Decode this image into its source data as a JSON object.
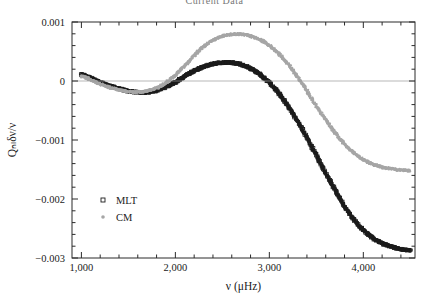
{
  "figure": {
    "clipped_title": "Current Data"
  },
  "chart_data": {
    "type": "scatter",
    "title": "Current Data",
    "xlabel": "ν (μHz)",
    "ylabel": "Qₙₗδν/ν",
    "xlim": [
      900,
      4550
    ],
    "ylim": [
      -0.003,
      0.001
    ],
    "xticks": [
      1000,
      2000,
      3000,
      4000
    ],
    "xtick_labels": [
      "1,000",
      "2,000",
      "3,000",
      "4,000"
    ],
    "yticks": [
      0.001,
      0,
      -0.001,
      -0.002,
      -0.003
    ],
    "ytick_labels": [
      "0.001",
      "0",
      "−0.001",
      "−0.002",
      "−0.003"
    ],
    "x_minor_per_major": 5,
    "y_minor_per_major": 5,
    "grid": false,
    "zero_line": 0,
    "legend_position": "lower-left",
    "series": [
      {
        "name": "MLT",
        "color": "#1c1c1c",
        "marker": "open-square",
        "x": [
          1000,
          1100,
          1200,
          1300,
          1400,
          1500,
          1600,
          1700,
          1800,
          1900,
          2000,
          2100,
          2200,
          2300,
          2400,
          2500,
          2600,
          2700,
          2800,
          2900,
          3000,
          3100,
          3200,
          3300,
          3400,
          3500,
          3600,
          3700,
          3800,
          3900,
          4000,
          4100,
          4200,
          4300,
          4400,
          4500
        ],
        "y": [
          0.00011,
          5e-05,
          -2e-05,
          -8e-05,
          -0.00013,
          -0.00017,
          -0.00019,
          -0.00019,
          -0.00016,
          -0.0001,
          -2e-05,
          8e-05,
          0.00017,
          0.00024,
          0.00029,
          0.00031,
          0.00031,
          0.00028,
          0.00021,
          0.00011,
          -3e-05,
          -0.00021,
          -0.00043,
          -0.00068,
          -0.00096,
          -0.00126,
          -0.00156,
          -0.00185,
          -0.00212,
          -0.00235,
          -0.00253,
          -0.00266,
          -0.00275,
          -0.00281,
          -0.00285,
          -0.00287
        ]
      },
      {
        "name": "CM",
        "color": "#a6a6a6",
        "marker": "filled-dot",
        "x": [
          1000,
          1100,
          1200,
          1300,
          1400,
          1500,
          1600,
          1700,
          1800,
          1900,
          2000,
          2100,
          2200,
          2300,
          2400,
          2500,
          2600,
          2700,
          2800,
          2900,
          3000,
          3100,
          3200,
          3300,
          3400,
          3500,
          3600,
          3700,
          3800,
          3900,
          4000,
          4100,
          4200,
          4300,
          4400,
          4500
        ],
        "y": [
          8e-05,
          2e-05,
          -5e-05,
          -0.00011,
          -0.00015,
          -0.00018,
          -0.00019,
          -0.00017,
          -0.00012,
          -3e-05,
          0.0001,
          0.00026,
          0.00043,
          0.00058,
          0.00069,
          0.00076,
          0.00079,
          0.00079,
          0.00076,
          0.0007,
          0.0006,
          0.00046,
          0.00028,
          7e-05,
          -0.00017,
          -0.00042,
          -0.00066,
          -0.00088,
          -0.00107,
          -0.00122,
          -0.00133,
          -0.00141,
          -0.00146,
          -0.00149,
          -0.00151,
          -0.00152
        ]
      }
    ],
    "legend": [
      {
        "label": "MLT",
        "marker": "open-square",
        "color": "#1c1c1c"
      },
      {
        "label": "CM",
        "marker": "filled-dot",
        "color": "#a6a6a6"
      }
    ]
  }
}
